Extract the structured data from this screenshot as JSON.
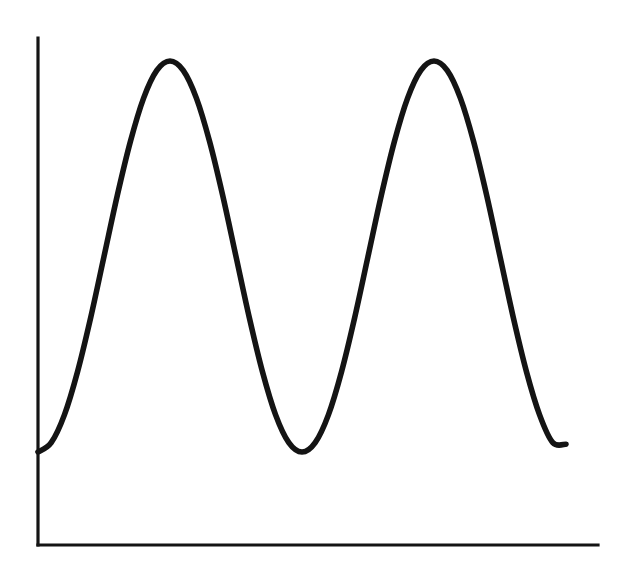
{
  "figure": {
    "background_color": "#ffffff",
    "ink_color": "#141414",
    "width": 618,
    "height": 570,
    "title": "",
    "caption": ""
  },
  "axes": {
    "origin_x": 38,
    "origin_y": 545,
    "y_axis_top_y": 38,
    "x_axis_right_x": 598,
    "axis_stroke_width": 3.2,
    "x_axis_label": "",
    "y_axis_label": "",
    "x_tick_labels": [],
    "y_tick_labels": [],
    "grid": "off"
  },
  "chart_data": {
    "type": "line",
    "title": "",
    "subtitle": "",
    "xlabel": "",
    "ylabel": "",
    "grid": "off",
    "legend": "none",
    "legend_entries": [],
    "annotations": [],
    "xlim": [
      0,
      2.01
    ],
    "ylim": [
      0,
      1.0
    ],
    "x_tick_labels": [],
    "y_tick_labels": [],
    "curve_style": {
      "stroke_color": "#141414",
      "stroke_width": 5.6,
      "line_cap": "round",
      "fill": "none"
    },
    "description": "Smooth sinusoidal wave with two full crests drawn on bare x and y axes with no tick marks or labels.",
    "function": "y = 0.5 - 0.5*cos(2*pi*x)",
    "period_px": 263,
    "amplitude_px": 195.5,
    "baseline_px": 256.5,
    "features": [
      {
        "name": "curve-start",
        "kind": "endpoint",
        "x_px": 38,
        "y_px": 452,
        "x": 0.0,
        "y": 0.0
      },
      {
        "name": "peak-1",
        "kind": "maximum",
        "x_px": 164,
        "y_px": 61,
        "x": 0.5,
        "y": 1.0
      },
      {
        "name": "valley-1",
        "kind": "minimum",
        "x_px": 302,
        "y_px": 452,
        "x": 1.0,
        "y": 0.0
      },
      {
        "name": "peak-2",
        "kind": "maximum",
        "x_px": 427,
        "y_px": 61,
        "x": 1.5,
        "y": 1.0
      },
      {
        "name": "curve-end",
        "kind": "endpoint",
        "x_px": 566,
        "y_px": 444,
        "x": 2.0,
        "y": 0.02
      }
    ],
    "series": [
      {
        "name": "wave",
        "x": [
          0.0,
          0.05,
          0.1,
          0.15,
          0.2,
          0.25,
          0.3,
          0.35,
          0.4,
          0.45,
          0.5,
          0.55,
          0.6,
          0.65,
          0.7,
          0.75,
          0.8,
          0.85,
          0.9,
          0.95,
          1.0,
          1.05,
          1.1,
          1.15,
          1.2,
          1.25,
          1.3,
          1.35,
          1.4,
          1.45,
          1.5,
          1.55,
          1.6,
          1.65,
          1.7,
          1.75,
          1.8,
          1.85,
          1.9,
          1.95,
          2.0
        ],
        "values": [
          0.0,
          0.024,
          0.095,
          0.206,
          0.345,
          0.5,
          0.655,
          0.794,
          0.905,
          0.976,
          1.0,
          0.976,
          0.905,
          0.794,
          0.655,
          0.5,
          0.345,
          0.206,
          0.095,
          0.024,
          0.0,
          0.024,
          0.095,
          0.206,
          0.345,
          0.5,
          0.655,
          0.794,
          0.905,
          0.976,
          1.0,
          0.976,
          0.905,
          0.794,
          0.655,
          0.5,
          0.345,
          0.206,
          0.095,
          0.024,
          0.02
        ]
      }
    ]
  }
}
